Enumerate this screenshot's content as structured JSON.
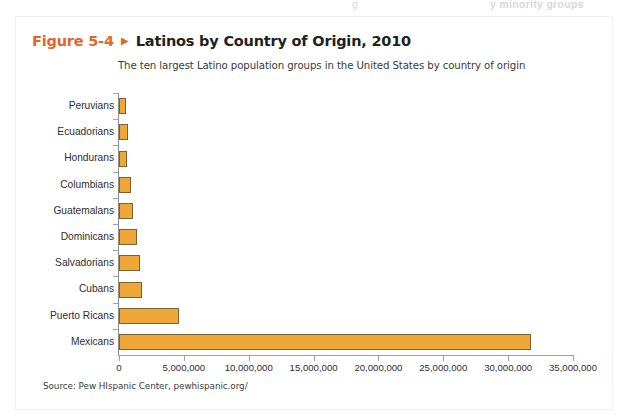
{
  "page_bleed": {
    "fragment_left": "g",
    "fragment_right": "y minority groups"
  },
  "figure": {
    "number_label": "Figure 5-4",
    "arrow_glyph": "▶",
    "title": "Latinos by Country of Origin, 2010",
    "subtitle": "The ten largest Latino population groups in the United States by country of origin",
    "source": "Source: Pew HIspanic Center, pewhispanic.org/",
    "accent_color": "#e0672c",
    "bar_fill_color": "#efa838",
    "bar_border_color": "#7a6234"
  },
  "chart_data": {
    "type": "bar",
    "orientation": "horizontal",
    "title": "Latinos by Country of Origin, 2010",
    "subtitle": "The ten largest Latino population groups in the United States by country of origin",
    "xlabel": "",
    "ylabel": "",
    "categories": [
      "Peruvians",
      "Ecuadorians",
      "Hondurans",
      "Columbians",
      "Guatemalans",
      "Dominicans",
      "Salvadorians",
      "Cubans",
      "Puerto Ricans",
      "Mexicans"
    ],
    "values": [
      531358,
      664945,
      633401,
      908734,
      1044209,
      1414703,
      1648968,
      1785547,
      4623716,
      31798258
    ],
    "xlim": [
      0,
      35000000
    ],
    "xticks": [
      0,
      5000000,
      10000000,
      15000000,
      20000000,
      25000000,
      30000000,
      35000000
    ],
    "xtick_labels": [
      "0",
      "5,000,000",
      "10,000,000",
      "15,000,000",
      "20,000,000",
      "25,000,000",
      "30,000,000",
      "35,000,000"
    ],
    "grid": false,
    "legend": false,
    "series_color": "#efa838"
  }
}
